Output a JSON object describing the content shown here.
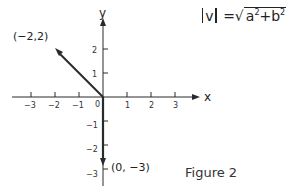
{
  "diagram": {
    "axes": {
      "x_label": "x",
      "y_label": "y",
      "origin_label": "0",
      "x_ticks": [
        {
          "value": -3,
          "label": "−3"
        },
        {
          "value": -2,
          "label": "−2"
        },
        {
          "value": -1,
          "label": "−1"
        },
        {
          "value": 1,
          "label": "1"
        },
        {
          "value": 2,
          "label": "2"
        },
        {
          "value": 3,
          "label": "3"
        }
      ],
      "y_ticks": [
        {
          "value": 2,
          "label": "2"
        },
        {
          "value": 1,
          "label": "1"
        },
        {
          "value": -1,
          "label": "−1"
        },
        {
          "value": -2,
          "label": "−2"
        },
        {
          "value": -3,
          "label": "−3"
        }
      ]
    },
    "vectors": [
      {
        "from": [
          0,
          0
        ],
        "to": [
          -2,
          2
        ],
        "label": "(−2,2)"
      },
      {
        "from": [
          0,
          0
        ],
        "to": [
          0,
          -3
        ],
        "label": "(0, −3)"
      }
    ],
    "formula": {
      "lhs": "v",
      "equals": "=",
      "radicand_a": "a",
      "radicand_plus": "+",
      "radicand_b": "b",
      "exponent": "2"
    },
    "caption": "Figure 2"
  }
}
